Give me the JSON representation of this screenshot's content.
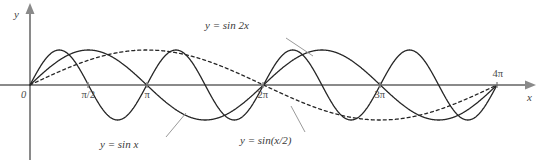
{
  "figure": {
    "background_color": "#ffffff",
    "width": 537,
    "height": 166
  },
  "axes": {
    "x_axis_label": "x",
    "y_axis_label": "y",
    "axis_color": "#8a8a8a",
    "origin_px": {
      "x": 30,
      "y": 85
    },
    "x_unit_px_per_pi": 116.75,
    "amplitude_px": 35,
    "x_arrow_end_px": 525,
    "y_arrow_top_px": 14,
    "y_axis_bottom_px": 160,
    "ticks": [
      {
        "label": "0",
        "x_value": 0,
        "x_px": 30,
        "position": "below-left"
      },
      {
        "label": "π/2",
        "x_value": 1.5707963,
        "x_px": 88,
        "position": "below"
      },
      {
        "label": "π",
        "x_value": 3.1415927,
        "x_px": 147,
        "position": "below"
      },
      {
        "label": "2π",
        "x_value": 6.2831853,
        "x_px": 263,
        "position": "below"
      },
      {
        "label": "3π",
        "x_value": 9.424778,
        "x_px": 380,
        "position": "below"
      },
      {
        "label": "4π",
        "x_value": 12.566371,
        "x_px": 497,
        "position": "above"
      }
    ]
  },
  "curves": [
    {
      "id": "sin2x",
      "label": "y = sin 2x",
      "expression": "sin(2x)",
      "frequency": 2,
      "amplitude": 1,
      "style": "solid",
      "color": "#262626",
      "stroke_width": 1.3,
      "label_px": {
        "x": 205,
        "y": 19
      },
      "leader_from_px": {
        "x": 286,
        "y": 38
      },
      "leader_to_px": {
        "x": 313,
        "y": 56
      }
    },
    {
      "id": "sinx",
      "label": "y = sin x",
      "expression": "sin(x)",
      "frequency": 1,
      "amplitude": 1,
      "style": "solid",
      "color": "#262626",
      "stroke_width": 1.3,
      "label_px": {
        "x": 100,
        "y": 138
      },
      "leader_from_px": {
        "x": 166,
        "y": 137
      },
      "leader_to_px": {
        "x": 186,
        "y": 113
      }
    },
    {
      "id": "sinxover2",
      "label": "y = sin(x/2)",
      "expression": "sin(x/2)",
      "frequency": 0.5,
      "amplitude": 1,
      "style": "dashed",
      "color": "#262626",
      "stroke_width": 1.3,
      "dash_pattern": "3,3",
      "label_px": {
        "x": 240,
        "y": 134
      },
      "leader_from_px": {
        "x": 305,
        "y": 132
      },
      "leader_to_px": {
        "x": 291,
        "y": 106
      }
    }
  ],
  "chart_data": {
    "type": "line",
    "title": "",
    "xlabel": "x",
    "ylabel": "y",
    "xlim": [
      0,
      12.566371
    ],
    "ylim": [
      -1,
      1
    ],
    "grid": false,
    "legend": "inline-annotations",
    "x_tick_labels": [
      "0",
      "π/2",
      "π",
      "2π",
      "3π",
      "4π"
    ],
    "x_tick_values": [
      0,
      1.5707963,
      3.1415927,
      6.2831853,
      9.424778,
      12.566371
    ],
    "series": [
      {
        "name": "y = sin 2x",
        "formula": "sin(2x)",
        "style": "solid",
        "period": 3.1415927,
        "zeros": [
          0,
          1.5707963,
          3.1415927,
          4.712389,
          6.2831853,
          7.8539816,
          9.424778,
          10.9955743,
          12.566371
        ],
        "maxima_x": [
          0.7853982,
          3.9269908,
          7.0685835,
          10.2101761
        ],
        "minima_x": [
          2.3561945,
          5.4977871,
          8.6393798,
          11.7809725
        ],
        "values_at_ticks": [
          0,
          0,
          0,
          0,
          0,
          0
        ]
      },
      {
        "name": "y = sin x",
        "formula": "sin(x)",
        "style": "solid",
        "period": 6.2831853,
        "zeros": [
          0,
          3.1415927,
          6.2831853,
          9.424778,
          12.566371
        ],
        "maxima_x": [
          1.5707963,
          7.8539816
        ],
        "minima_x": [
          4.712389,
          10.9955743
        ],
        "values_at_ticks": [
          0,
          1,
          0,
          0,
          0,
          0
        ]
      },
      {
        "name": "y = sin(x/2)",
        "formula": "sin(x/2)",
        "style": "dashed",
        "period": 12.566371,
        "zeros": [
          0,
          6.2831853,
          12.566371
        ],
        "maxima_x": [
          3.1415927
        ],
        "minima_x": [
          9.424778
        ],
        "values_at_ticks": [
          0,
          0.7071068,
          1,
          0,
          -1,
          0
        ]
      }
    ]
  }
}
